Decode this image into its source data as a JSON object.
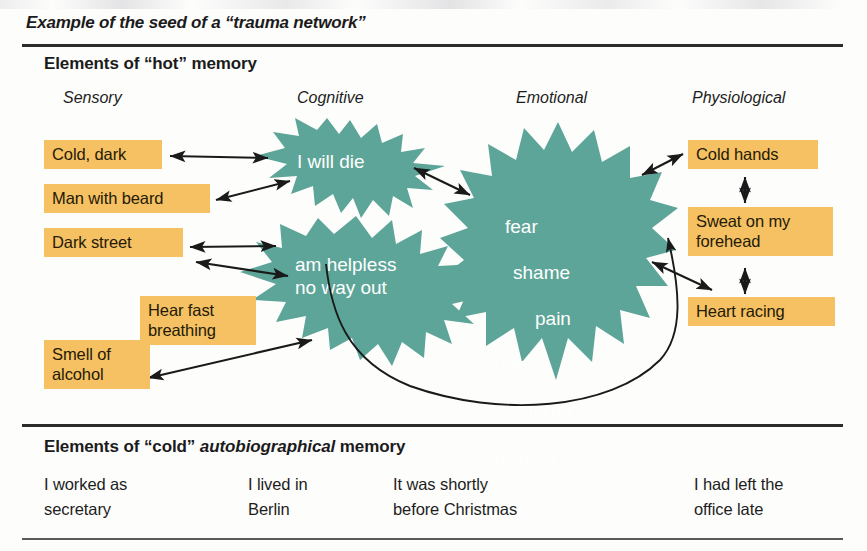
{
  "figure": {
    "title": "Example of the seed of a “trauma network”",
    "hot_section_title": "Elements of “hot” memory",
    "cold_section_title_part1": "Elements of “cold” ",
    "cold_section_title_italic": "autobiographical",
    "cold_section_title_part2": " memory"
  },
  "colors": {
    "star_fill": "#5da598",
    "box_fill": "#f5c163",
    "box_text": "#241a06",
    "star_text": "#ffffff",
    "rule": "#2c2c2c",
    "connector": "#1a1a1a",
    "page_background": "#fdfdfc"
  },
  "columns": [
    {
      "label": "Sensory"
    },
    {
      "label": "Cognitive"
    },
    {
      "label": "Emotional"
    },
    {
      "label": "Physiological"
    }
  ],
  "sensory_boxes": [
    {
      "label": "Cold, dark"
    },
    {
      "label": "Man with beard"
    },
    {
      "label": "Dark street"
    },
    {
      "label": "Hear fast\nbreathing"
    },
    {
      "label": "Smell of\nalcohol"
    }
  ],
  "cognitive_stars": [
    {
      "label": "I will die"
    },
    {
      "label": "am helpless\nno way out"
    }
  ],
  "emotional_star": {
    "lines": [
      "fear",
      "shame",
      "pain",
      "panic",
      "horror",
      "disgust"
    ]
  },
  "physiological_boxes": [
    {
      "label": "Cold hands"
    },
    {
      "label": "Sweat on my\nforehead"
    },
    {
      "label": "Heart racing"
    }
  ],
  "cold_memory_items": [
    {
      "label": "I worked as\nsecretary"
    },
    {
      "label": "I lived in\nBerlin"
    },
    {
      "label": "It was shortly\nbefore Christmas"
    },
    {
      "label": "I had left the\noffice late"
    }
  ],
  "connectors": [
    {
      "name": "cold-dark-to-i-will-die",
      "type": "double-arrow"
    },
    {
      "name": "man-with-beard-to-i-will-die",
      "type": "double-arrow"
    },
    {
      "name": "dark-street-to-cognitive",
      "type": "double-arrow"
    },
    {
      "name": "dark-street-to-helpless",
      "type": "double-arrow"
    },
    {
      "name": "smell-of-alcohol-to-helpless",
      "type": "double-arrow"
    },
    {
      "name": "i-will-die-to-emotional",
      "type": "double-arrow"
    },
    {
      "name": "emotional-to-cold-hands",
      "type": "double-arrow"
    },
    {
      "name": "emotional-to-heart-racing",
      "type": "double-arrow"
    },
    {
      "name": "cognitive-loop-to-emotional",
      "type": "curved-arrow"
    },
    {
      "name": "cold-hands-to-sweat",
      "type": "vertical-double-arrow"
    },
    {
      "name": "sweat-to-heart-racing",
      "type": "vertical-double-arrow"
    }
  ]
}
